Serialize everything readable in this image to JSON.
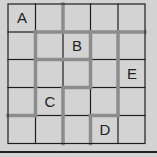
{
  "puzzle": {
    "rows": 5,
    "cols": 5,
    "colors": {
      "background": "#d3d3d3",
      "thin_line": "#1e1e1e",
      "thick_path": "#8c8c8c"
    },
    "labels": [
      {
        "text": "A",
        "row": 0,
        "col": 0
      },
      {
        "text": "B",
        "row": 1,
        "col": 2
      },
      {
        "text": "E",
        "row": 2,
        "col": 4
      },
      {
        "text": "C",
        "row": 3,
        "col": 1
      },
      {
        "text": "D",
        "row": 4,
        "col": 3
      }
    ],
    "horizontal_segments": [
      [
        "thin",
        "thick",
        "thick",
        "thick",
        "thick"
      ],
      [
        "thin",
        "thick",
        "thick",
        "thin",
        "thin"
      ],
      [
        "thin",
        "thin",
        "thick",
        "thin",
        "thin"
      ],
      [
        "thick",
        "thin",
        "thin",
        "thick",
        "thin"
      ]
    ],
    "vertical_segments": [
      [
        "thin",
        "thick",
        "thick",
        "thick",
        "thin"
      ],
      [
        "thick",
        "thin",
        "thin",
        "thick",
        "thick"
      ],
      [
        "thin",
        "thick",
        "thick",
        "thin",
        "thick"
      ],
      [
        "thin",
        "thick",
        "thick",
        "thick",
        "thin"
      ]
    ]
  }
}
